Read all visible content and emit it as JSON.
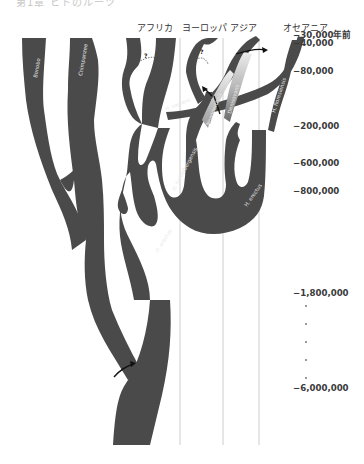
{
  "header": {
    "cut_off_title": "第1章 ヒトのルーツ"
  },
  "regions": [
    {
      "label": "アフリカ",
      "x": 137
    },
    {
      "label": "ヨーロッパ",
      "x": 182
    },
    {
      "label": "アジア",
      "x": 230
    },
    {
      "label": "オセアニア",
      "x": 283
    }
  ],
  "timeline": [
    {
      "label": "−30,000年前",
      "y": 28
    },
    {
      "label": "−40,000",
      "y": 38
    },
    {
      "label": "−80,000",
      "y": 66
    },
    {
      "label": "−200,000",
      "y": 121
    },
    {
      "label": "−600,000",
      "y": 158
    },
    {
      "label": "−800,000",
      "y": 186
    },
    {
      "label": "−1,800,000",
      "y": 288
    },
    {
      "label": "−6,000,000",
      "y": 383
    }
  ],
  "species": {
    "bonobo": "Bonobo",
    "chimpanzee": "Chimpanzee",
    "sapiens": "H. sapiens",
    "neanderthals": "Neanderthals",
    "denisovans": "Denisovans",
    "floresiensis": "H. floresiensis",
    "heidelbergensis": "H. heidelbergensis",
    "erectus_africa": "H. erectus",
    "erectus_asia": "H. erectus"
  },
  "markers": {
    "unknown_1": "?",
    "unknown_2": "?"
  },
  "colors": {
    "tree": "#4a4a4a",
    "divider": "#d4d4d4",
    "text": "#333333",
    "arrow": "#111111"
  }
}
